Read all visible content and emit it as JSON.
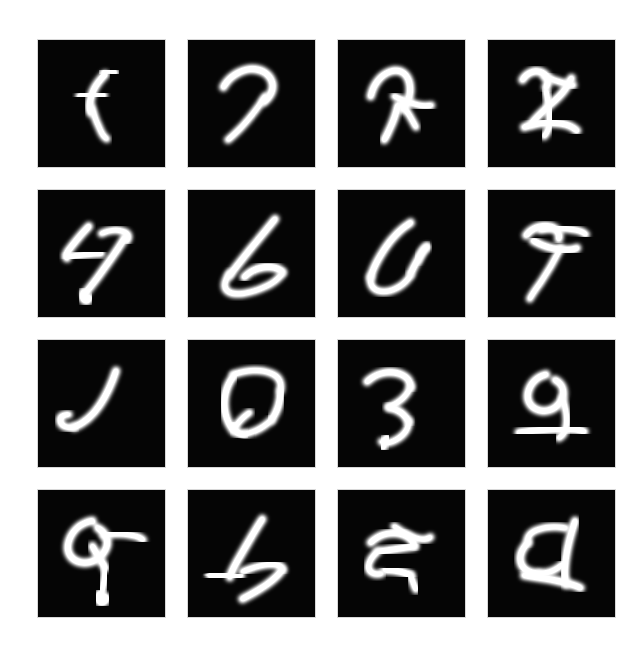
{
  "figure": {
    "type": "image-grid",
    "background_color": "#ffffff",
    "tile_background_color": "#050505",
    "stroke_color": "#ffffff",
    "rows": 4,
    "columns": 4,
    "tile_count": 16,
    "tile_width_px": 127,
    "tile_height_px": 127,
    "gap_px": 23,
    "grid_origin_x_px": 38,
    "grid_origin_y_px": 40,
    "canvas_width_px": 640,
    "canvas_height_px": 649
  },
  "samples": [
    {
      "index": 1,
      "row": 1,
      "col": 1,
      "label": "sample-r1c1",
      "reading": "f",
      "description": "thin vertical stroke with small crossbar, f-like"
    },
    {
      "index": 2,
      "row": 1,
      "col": 2,
      "label": "sample-r1c2",
      "reading": "7",
      "description": "hooked top bar descending to lower-left, 7-like"
    },
    {
      "index": 3,
      "row": 1,
      "col": 3,
      "label": "sample-r1c3",
      "reading": "n",
      "description": "arched loop with rightward branch, ambiguous blob"
    },
    {
      "index": 4,
      "row": 1,
      "col": 4,
      "label": "sample-r1c4",
      "reading": "8",
      "description": "crossed X-like form with upper hook and lower bar"
    },
    {
      "index": 5,
      "row": 2,
      "col": 1,
      "label": "sample-r2c1",
      "reading": "47",
      "description": "angular 4-like left mark with long diagonal 7 tail"
    },
    {
      "index": 6,
      "row": 2,
      "col": 2,
      "label": "sample-r2c2",
      "reading": "6",
      "description": "tall diagonal descending into a wide bowl, 6/L-like"
    },
    {
      "index": 7,
      "row": 2,
      "col": 3,
      "label": "sample-r2c3",
      "reading": "6",
      "description": "open U-shaped loop with rightward curl"
    },
    {
      "index": 8,
      "row": 2,
      "col": 4,
      "label": "sample-r2c4",
      "reading": "7",
      "description": "T-bar over a descending stem, 7-like"
    },
    {
      "index": 9,
      "row": 3,
      "col": 1,
      "label": "sample-r3c1",
      "reading": "J",
      "description": "hooked J stroke thick at the base curve"
    },
    {
      "index": 10,
      "row": 3,
      "col": 2,
      "label": "sample-r3c2",
      "reading": "0",
      "description": "closed angular loop, 0/D-like"
    },
    {
      "index": 11,
      "row": 3,
      "col": 3,
      "label": "sample-r3c3",
      "reading": "3",
      "description": "zig-zag double curve with tail, 3/z-like"
    },
    {
      "index": 12,
      "row": 3,
      "col": 4,
      "label": "sample-r3c4",
      "reading": "9",
      "description": "small top loop above a long baseline, 9/a-like"
    },
    {
      "index": 13,
      "row": 4,
      "col": 1,
      "label": "sample-r4c1",
      "reading": "9",
      "description": "round loop with long right arm and descending leg, 9/q-like"
    },
    {
      "index": 14,
      "row": 4,
      "col": 2,
      "label": "sample-r4c2",
      "reading": "4",
      "description": "angular 4 head with sweeping lower diagonal"
    },
    {
      "index": 15,
      "row": 4,
      "col": 3,
      "label": "sample-r4c3",
      "reading": "5",
      "description": "crossing strokes forming an A/5-like tangle"
    },
    {
      "index": 16,
      "row": 4,
      "col": 4,
      "label": "sample-r4c4",
      "reading": "d",
      "description": "closed left loop with tall right stem, d-like"
    }
  ],
  "paths": {
    "sample-r1c1": [
      "M 74 38 C 70 42 63 50 60 58 C 57 66 56 74 58 80",
      "M 72 36 C 76 33 82 33 85 36",
      "M 46 62 C 54 60 64 59 72 61",
      "M 59 74 C 62 84 66 94 70 102 C 72 106 74 108 76 109"
    ],
    "sample-r1c2": [
      "M 39 52 C 44 42 55 34 68 32 C 80 31 90 37 93 47 C 95 56 90 63 84 68",
      "M 85 62 C 78 74 68 86 59 96 C 53 102 48 107 44 110"
    ],
    "sample-r1c3": [
      "M 36 62 C 39 48 48 37 60 34 C 70 32 77 38 79 48 C 81 58 78 68 72 76",
      "M 62 62 C 70 66 80 70 90 72 C 96 73 100 73 103 72",
      "M 66 72 C 64 82 60 92 56 100 C 54 105 52 108 51 110",
      "M 70 70 C 76 78 82 88 86 96"
    ],
    "sample-r1c4": [
      "M 38 44 C 42 36 52 32 60 36 C 66 39 68 46 64 52",
      "M 62 40 C 72 44 84 48 94 50",
      "M 92 42 C 88 52 80 62 70 70 C 62 77 54 84 48 92",
      "M 64 56 C 66 66 68 78 68 88 C 68 96 66 102 62 106",
      "M 40 96 C 52 92 66 90 80 92 C 88 93 94 96 98 100"
    ],
    "sample-r2c1": [
      "M 56 40 C 48 48 40 58 34 66 C 31 70 30 73 32 75",
      "M 32 74 C 44 72 58 70 70 70",
      "M 56 52 C 56 62 56 72 56 80",
      "M 70 48 C 78 44 88 43 95 46 C 100 48 101 52 98 56",
      "M 96 52 C 88 66 76 82 66 96 C 60 104 55 110 52 114",
      "M 50 112 C 48 116 48 120 51 122 C 54 124 57 122 57 118"
    ],
    "sample-r2c2": [
      "M 96 32 C 88 42 78 54 68 66 C 60 76 52 86 46 94",
      "M 46 92 C 40 100 38 108 44 112 C 52 117 68 114 82 108 C 92 104 100 98 104 92",
      "M 104 90 C 100 86 92 84 84 85 C 76 86 68 90 62 96"
    ],
    "sample-r2c3": [
      "M 80 36 C 70 42 60 52 52 64 C 44 76 38 88 36 96",
      "M 36 96 C 34 106 40 112 50 112 C 62 112 74 104 80 94",
      "M 80 92 C 84 84 88 76 92 70 C 94 66 96 64 98 63",
      "M 98 62 C 94 66 90 72 88 78"
    ],
    "sample-r2c4": [
      "M 42 50 C 48 42 58 38 68 40 C 76 42 80 48 78 54",
      "M 58 44 C 70 42 84 42 96 44 C 102 45 106 47 108 49",
      "M 50 56 C 60 62 74 66 86 66 C 92 66 96 65 98 64",
      "M 80 64 C 74 76 66 90 58 102 C 52 110 48 116 46 120"
    ],
    "sample-r3c1": [
      "M 86 34 C 82 46 76 60 68 72 C 60 84 50 92 40 96",
      "M 40 96 C 30 98 24 94 24 88 C 24 84 28 82 34 82"
    ],
    "sample-r3c2": [
      "M 50 40 C 44 48 40 58 40 70 C 40 82 44 92 50 100",
      "M 50 38 C 62 34 78 32 90 36 C 100 39 104 46 102 56",
      "M 102 56 C 102 68 98 80 92 88",
      "M 92 88 C 84 96 72 102 62 104",
      "M 62 104 C 54 104 50 100 50 94",
      "M 52 96 C 56 90 62 84 68 80"
    ],
    "sample-r3c3": [
      "M 32 46 C 40 38 52 34 64 36 C 74 38 80 44 80 52",
      "M 80 52 C 76 62 66 70 56 74",
      "M 56 74 C 66 76 74 82 78 90",
      "M 78 90 C 78 100 70 108 60 112 C 54 114 50 114 48 112",
      "M 54 108 C 50 112 48 116 50 118"
    ],
    "sample-r3c4": [
      "M 64 38 C 54 40 46 48 44 58 C 42 68 48 76 58 78 C 68 80 78 74 82 64 C 85 56 82 48 74 44",
      "M 82 64 C 86 76 88 88 86 96 C 85 102 82 106 78 108",
      "M 34 102 C 48 100 66 98 84 98 C 94 98 102 99 106 101"
    ],
    "sample-r4c1": [
      "M 60 34 C 48 36 38 44 34 56 C 30 68 36 78 48 80 C 60 82 72 74 76 62 C 78 54 74 46 66 42",
      "M 72 50 C 82 48 94 48 104 50 C 110 51 114 53 116 55",
      "M 60 62 C 64 70 70 78 74 86",
      "M 74 86 C 74 96 72 106 70 114",
      "M 68 114 C 66 118 66 122 69 124 C 73 125 76 122 75 118"
    ],
    "sample-r4c2": [
      "M 82 32 C 74 44 66 58 58 72 C 52 82 48 90 46 96",
      "M 46 94 C 36 92 28 92 24 94",
      "M 24 94 C 34 96 46 96 58 94",
      "M 60 90 C 70 86 82 82 92 82 C 100 82 104 84 104 88",
      "M 104 88 C 98 96 88 104 78 110 C 70 115 64 118 60 120"
    ],
    "sample-r4c3": [
      "M 36 58 C 44 50 56 46 68 48 C 78 50 84 56 84 62",
      "M 62 40 C 70 46 80 52 90 54 C 96 55 100 54 102 52",
      "M 84 62 C 72 64 58 66 44 68",
      "M 44 68 C 36 74 32 82 34 88 C 36 92 42 94 48 92",
      "M 52 88 C 62 88 72 90 80 94",
      "M 80 94 C 82 100 84 106 86 110"
    ],
    "sample-r4c4": [
      "M 96 34 C 92 46 88 60 86 74 C 84 86 84 96 86 104",
      "M 86 42 C 76 40 64 40 54 44 C 46 47 42 52 44 58",
      "M 44 58 C 38 64 34 72 36 80 C 38 88 46 92 56 92",
      "M 56 92 C 66 92 76 88 82 82",
      "M 40 94 C 54 96 70 98 84 102 C 92 104 98 106 102 108"
    ]
  }
}
